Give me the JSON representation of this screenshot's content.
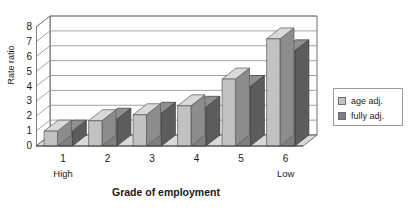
{
  "chart_data": {
    "type": "bar",
    "title": "",
    "subtitle": "",
    "xlabel": "Grade of employment",
    "ylabel": "Rate ratio",
    "categories": [
      "1",
      "2",
      "3",
      "4",
      "5",
      "6"
    ],
    "category_endcaps": {
      "left": "High",
      "right": "Low"
    },
    "series": [
      {
        "name": "age adj.",
        "color": "#c2c2c2",
        "values": [
          1.0,
          1.7,
          2.1,
          2.7,
          4.5,
          7.2
        ]
      },
      {
        "name": "fully adj.",
        "color": "#808080",
        "values": [
          1.0,
          1.8,
          2.2,
          2.6,
          4.0,
          6.4
        ]
      }
    ],
    "ylim": [
      0,
      8
    ],
    "yticks": [
      0,
      1,
      2,
      3,
      4,
      5,
      6,
      7,
      8
    ],
    "ytick_labels": [
      "0",
      "1",
      "2",
      "3",
      "4",
      "5",
      "6",
      "7",
      "8"
    ],
    "grid": true,
    "grid_axis": "y",
    "legend_position": "right",
    "style": "3d-column"
  },
  "axes": {
    "y_title": "Rate ratio",
    "x_title": "Grade of employment"
  },
  "legend": {
    "entries": [
      {
        "label": "age adj."
      },
      {
        "label": "fully adj."
      }
    ]
  },
  "colors": {
    "series_age_adj": "#c2c2c2",
    "series_fully_adj": "#808080",
    "grid": "#8d8d8d",
    "axis": "#4d4d4d",
    "background": "#ffffff",
    "floor": "#d9d9d9"
  }
}
